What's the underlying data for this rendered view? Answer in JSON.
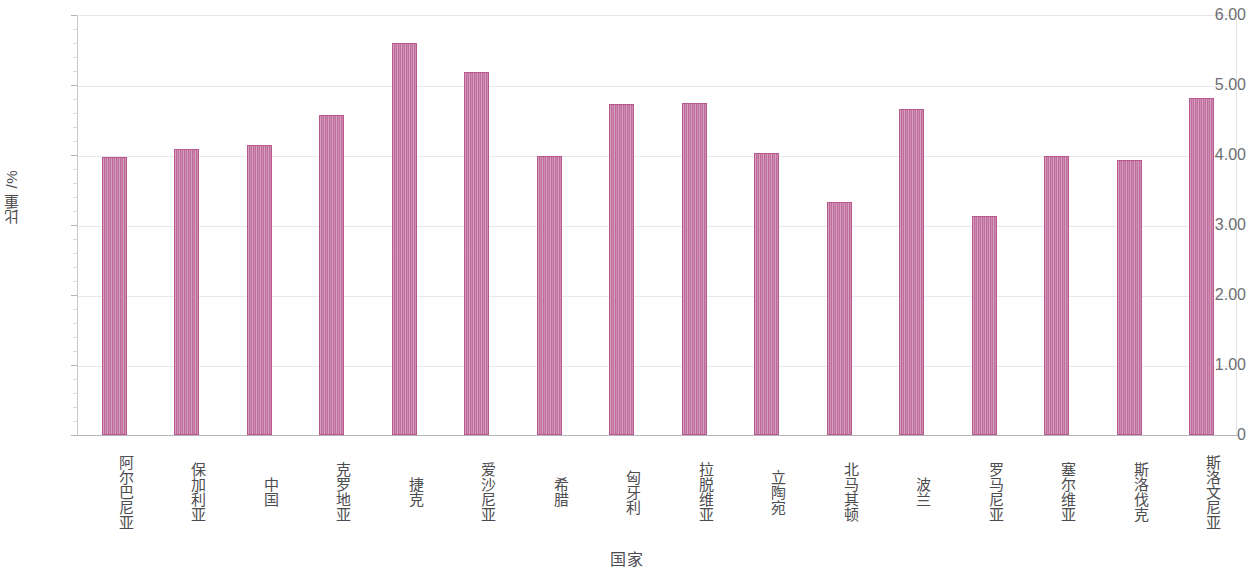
{
  "chart_data": {
    "type": "bar",
    "title": "",
    "xlabel": "国家",
    "ylabel": "比重 /%",
    "ylim": [
      0,
      6.0
    ],
    "ytick_labels": [
      "6.00",
      "5.00",
      "4.00",
      "3.00",
      "2.00",
      "1.00",
      "0"
    ],
    "ytick_values": [
      6.0,
      5.0,
      4.0,
      3.0,
      2.0,
      1.0,
      0
    ],
    "grid": true,
    "legend": "none",
    "bar_color": "#c578a4",
    "bar_edge_color": "#b8588e",
    "categories": [
      "阿尔巴尼亚",
      "保加利亚",
      "中国",
      "克罗地亚",
      "捷克",
      "爱沙尼亚",
      "希腊",
      "匈牙利",
      "拉脱维亚",
      "立陶宛",
      "北马其顿",
      "波兰",
      "罗马尼亚",
      "塞尔维亚",
      "斯洛伐克",
      "斯洛文尼亚"
    ],
    "values": [
      3.97,
      4.09,
      4.15,
      4.57,
      5.6,
      5.19,
      3.98,
      4.73,
      4.74,
      4.03,
      3.33,
      4.66,
      3.13,
      3.99,
      3.93,
      4.82
    ]
  }
}
